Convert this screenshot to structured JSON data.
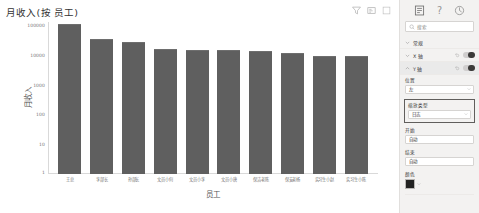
{
  "visual": {
    "title": "月收入(按 员工)",
    "header_icons": [
      {
        "name": "filter-icon",
        "label": "筛选器"
      },
      {
        "name": "focus-mode-icon",
        "label": "聚焦模式"
      },
      {
        "name": "more-options-icon",
        "label": "更多选项"
      }
    ]
  },
  "chart_data": {
    "type": "bar",
    "title": "月收入(按 员工)",
    "xlabel": "员工",
    "ylabel": "月收入",
    "yscale": "log",
    "ylim": [
      1,
      100000
    ],
    "yticks": [
      "100000",
      "10000",
      "1000",
      "100",
      "10",
      "1"
    ],
    "grid": false,
    "legend": "none",
    "bar_color": "#5f5f5f",
    "categories": [
      "王总",
      "李部长",
      "孙部长",
      "文员小何",
      "文员小李",
      "文员小唐",
      "保洁老陈",
      "保安老杨",
      "实习生小赵",
      "实习生小陈"
    ],
    "values": [
      80000,
      25000,
      20000,
      12000,
      11500,
      11000,
      10000,
      9000,
      7000,
      7000
    ]
  },
  "pane": {
    "tabs": [
      {
        "name": "format-tab",
        "label": "格式",
        "active": true
      },
      {
        "name": "help-tab",
        "label": "帮助",
        "active": false
      },
      {
        "name": "analytics-tab",
        "label": "分析",
        "active": false
      }
    ],
    "search": {
      "placeholder": "搜索"
    },
    "sections": [
      {
        "name": "general",
        "label": "常规",
        "expanded": false,
        "toggle": null,
        "selected": false
      },
      {
        "name": "x-axis",
        "label": "X 轴",
        "expanded": false,
        "toggle": "on",
        "selected": false
      },
      {
        "name": "y-axis",
        "label": "Y 轴",
        "expanded": true,
        "toggle": "on",
        "selected": true
      }
    ],
    "fields": [
      {
        "name": "position",
        "label": "位置",
        "value": "左"
      },
      {
        "name": "scale-type",
        "label": "缩放类型",
        "value": "日志",
        "highlight": true
      },
      {
        "name": "start",
        "label": "开始",
        "value": "自动"
      },
      {
        "name": "end",
        "label": "结束",
        "value": "自动"
      }
    ],
    "color": {
      "label": "颜色",
      "value": "#222222"
    }
  }
}
